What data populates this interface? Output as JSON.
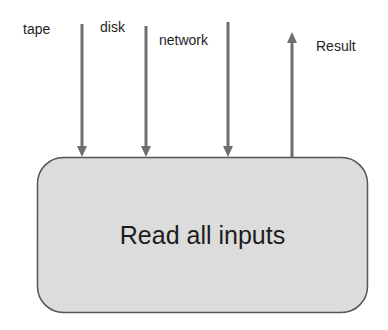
{
  "diagram": {
    "process": {
      "label": "Read all inputs"
    },
    "inputs": [
      {
        "label": "tape",
        "direction": "in"
      },
      {
        "label": "disk",
        "direction": "in"
      },
      {
        "label": "network",
        "direction": "in"
      }
    ],
    "outputs": [
      {
        "label": "Result",
        "direction": "out"
      }
    ],
    "colors": {
      "box_fill": "#dcdcdc",
      "box_stroke": "#555555",
      "arrow": "#6e6e6e",
      "text": "#1e1e1e"
    }
  }
}
